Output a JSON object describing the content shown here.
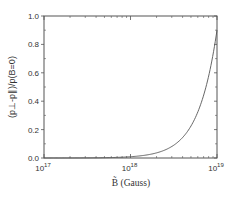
{
  "chart_data": {
    "type": "line",
    "title": "",
    "xlabel": "B̃ (Gauss)",
    "ylabel": "(p⊥-p∥)/p(B=0)",
    "xscale": "log",
    "xlim": [
      1e+17,
      1e+19
    ],
    "ylim": [
      0.0,
      1.0
    ],
    "x_ticks": [
      {
        "base": "10",
        "exp": "17",
        "value": 1e+17
      },
      {
        "base": "10",
        "exp": "18",
        "value": 1e+18
      },
      {
        "base": "10",
        "exp": "19",
        "value": 1e+19
      }
    ],
    "y_ticks": [
      "0.0",
      "0.2",
      "0.4",
      "0.6",
      "0.8",
      "1.0"
    ],
    "grid": false,
    "legend": null,
    "series": [
      {
        "name": "curve",
        "color": "#555555",
        "x": [
          1e+17,
          3.16e+17,
          1e+18,
          2e+18,
          3.16e+18,
          5e+18,
          7e+18,
          8.5e+18,
          1e+19
        ],
        "y": [
          0.0001,
          0.0009,
          0.009,
          0.036,
          0.09,
          0.225,
          0.441,
          0.65,
          0.9
        ]
      }
    ]
  },
  "plot": {
    "left": 44,
    "right": 217,
    "top": 16,
    "bottom": 158,
    "axis_color": "#555555"
  }
}
